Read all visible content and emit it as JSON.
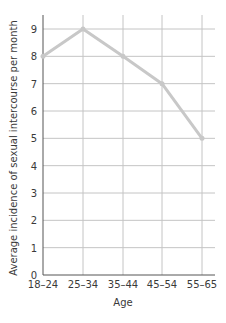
{
  "chart_data": {
    "type": "line",
    "title": "",
    "xlabel": "Age",
    "ylabel": "Average incidence of sexual intercourse per month",
    "categories": [
      "18–24",
      "25–34",
      "35–44",
      "45–54",
      "55–65"
    ],
    "series": [
      {
        "name": "Average incidence",
        "values": [
          8,
          9,
          8,
          7,
          5
        ]
      }
    ],
    "ylim": [
      0,
      9
    ],
    "yticks": [
      0,
      1,
      2,
      3,
      4,
      5,
      6,
      7,
      8,
      9
    ],
    "grid": true,
    "legend": null,
    "colors": {
      "line": "#c8c8c8",
      "grid": "#c4c4c4",
      "axis": "#555555"
    }
  }
}
